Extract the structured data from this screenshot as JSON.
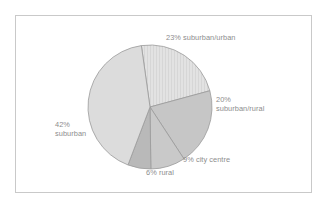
{
  "figure": {
    "name": "pie-chart-figure",
    "background_color": "#ffffff",
    "frame_color": "#c9c9c9",
    "label_color": "#8d8d8d"
  },
  "labels": {
    "suburban_urban": "23% suburban/urban",
    "suburban_rural": "20%\nsuburban/rural",
    "city_centre": "9% city centre",
    "rural": "6% rural",
    "suburban": "42%\nsuburban"
  },
  "chart_data": {
    "type": "pie",
    "title": "",
    "xlabel": "",
    "ylabel": "",
    "legend_position": "none",
    "labels_inline": true,
    "start_angle_deg": -8,
    "direction": "clockwise",
    "center": [
      150,
      107
    ],
    "radius": 62,
    "categories": [
      "suburban/urban",
      "suburban/rural",
      "city centre",
      "rural",
      "suburban"
    ],
    "values": [
      23,
      20,
      9,
      6,
      42
    ],
    "value_labels": [
      "23% suburban/urban",
      "20% suburban/rural",
      "9% city centre",
      "6% rural",
      "42% suburban"
    ],
    "total": 100,
    "units": "percent",
    "slice_colors": [
      "#dedede",
      "#c6c6c6",
      "#c9c9c9",
      "#b9b9b9",
      "#dcdcdc"
    ],
    "slice_edge_color": "#9a9a9a",
    "slice_patterns": [
      "vertical-hatch",
      "solid",
      "solid",
      "solid",
      "solid"
    ]
  }
}
